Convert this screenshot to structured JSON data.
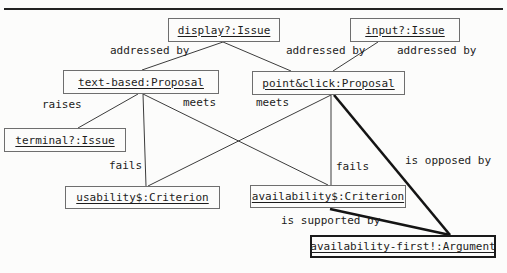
{
  "figure": {
    "nodes": {
      "display_issue": {
        "label": "display?:Issue"
      },
      "input_issue": {
        "label": "input?:Issue"
      },
      "text_based_proposal": {
        "label": "text-based:Proposal"
      },
      "point_click_proposal": {
        "label": "point&click:Proposal"
      },
      "terminal_issue": {
        "label": "terminal?:Issue"
      },
      "usability_criterion": {
        "label": "usability$:Criterion"
      },
      "availability_criterion": {
        "label": "availability$:Criterion"
      },
      "availability_first_argument": {
        "label": "availability-first!:Argument"
      }
    },
    "edge_labels": {
      "addressed_by_1": "addressed by",
      "addressed_by_2": "addressed by",
      "addressed_by_3": "addressed by",
      "raises": "raises",
      "meets_left": "meets",
      "meets_right": "meets",
      "fails_left": "fails",
      "fails_right": "fails",
      "is_opposed_by": "is opposed by",
      "is_supported_by": "is supported by"
    },
    "relations": [
      {
        "from": "display?:Issue",
        "to": "text-based:Proposal",
        "label": "addressed by"
      },
      {
        "from": "display?:Issue",
        "to": "point&click:Proposal",
        "label": "addressed by"
      },
      {
        "from": "input?:Issue",
        "to": "point&click:Proposal",
        "label": "addressed by"
      },
      {
        "from": "text-based:Proposal",
        "to": "terminal?:Issue",
        "label": "raises"
      },
      {
        "from": "text-based:Proposal",
        "to": "usability$:Criterion",
        "label": "fails"
      },
      {
        "from": "text-based:Proposal",
        "to": "availability$:Criterion",
        "label": "meets"
      },
      {
        "from": "point&click:Proposal",
        "to": "usability$:Criterion",
        "label": "meets"
      },
      {
        "from": "point&click:Proposal",
        "to": "availability$:Criterion",
        "label": "fails"
      },
      {
        "from": "point&click:Proposal",
        "to": "availability-first!:Argument",
        "label": "is opposed by"
      },
      {
        "from": "availability$:Criterion",
        "to": "availability-first!:Argument",
        "label": "is supported by"
      }
    ],
    "colors": {
      "ink": "#1c1c1c",
      "line": "#3c3c3c",
      "emphasis_line": "#141414",
      "background": "#fcfcfb"
    }
  }
}
